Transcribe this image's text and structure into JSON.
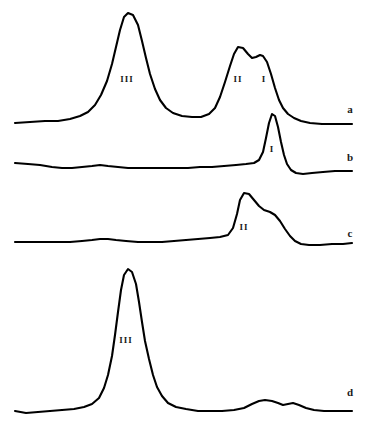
{
  "figure": {
    "type": "spectra-traces",
    "background_color": "#ffffff",
    "line_color": "#000000",
    "label_color": "#1a1a1a",
    "width": 368,
    "height": 428
  },
  "chart_data": {
    "type": "line",
    "title": "",
    "xlabel": "",
    "ylabel": "",
    "grid": false,
    "legend_position": "right-inline",
    "axis_visible": false,
    "xlim": [
      0,
      368
    ],
    "ylim": [
      428,
      0
    ],
    "note": "Four stacked chromatographic / electrophoretic traces labelled a-d; peaks annotated with Roman numerals I, II, III. Y axis is inverted screen space (smaller y = taller peak).",
    "series": [
      {
        "name": "a",
        "label": "a",
        "label_x": 350,
        "label_y": 110,
        "baseline_y": 125,
        "x_start": 15,
        "x_end": 352,
        "peaks": [
          {
            "label": "III",
            "apex_x": 124,
            "apex_y": 13,
            "height": 112,
            "label_x": 127,
            "label_y": 80
          },
          {
            "label": "II",
            "apex_x": 238,
            "apex_y": 46,
            "height": 79,
            "label_x": 238,
            "label_y": 80
          },
          {
            "label": "I",
            "apex_x": 263,
            "apex_y": 56,
            "height": 69,
            "label_x": 264,
            "label_y": 80
          }
        ],
        "path": "M 15,123 L 30,122 L 45,121 L 58,121 L 70,119 L 80,116 L 88,112 L 95,105 L 101,95 L 107,81 L 112,64 L 116,47 L 120,30 L 124,17 L 128,13 L 133,15 L 138,25 L 142,41 L 146,58 L 150,74 L 155,89 L 160,100 L 166,108 L 173,113 L 182,116 L 192,117 L 201,117 L 209,114 L 215,108 L 220,97 L 225,82 L 230,66 L 234,54 L 238,47 L 243,48 L 248,54 L 252,58 L 256,57 L 260,55 L 263,56 L 267,62 L 271,74 L 275,88 L 279,100 L 283,108 L 288,114 L 294,118 L 301,121 L 310,123 L 322,124 L 335,124 L 345,124 L 352,124"
      },
      {
        "name": "b",
        "label": "b",
        "label_x": 350,
        "label_y": 158,
        "baseline_y": 166,
        "x_start": 15,
        "x_end": 352,
        "peaks": [
          {
            "label": "I",
            "apex_x": 272,
            "apex_y": 113,
            "height": 53,
            "label_x": 272,
            "label_y": 150
          }
        ],
        "path": "M 15,163 L 28,164 L 40,165 L 52,167 L 62,168 L 72,168 L 82,167 L 92,166 L 100,165 L 108,166 L 118,167 L 128,168 L 140,168 L 152,168 L 164,168 L 176,168 L 188,168 L 200,167 L 212,167 L 224,166 L 236,165 L 246,164 L 254,163 L 259,160 L 263,152 L 266,138 L 269,123 L 272,114 L 275,116 L 278,127 L 281,142 L 284,155 L 287,164 L 291,170 L 296,173 L 303,174 L 312,173 L 323,172 L 335,171 L 345,171 L 352,171"
      },
      {
        "name": "c",
        "label": "c",
        "label_x": 350,
        "label_y": 234,
        "baseline_y": 243,
        "x_start": 15,
        "x_end": 352,
        "peaks": [
          {
            "label": "II",
            "apex_x": 244,
            "apex_y": 192,
            "height": 51,
            "label_x": 244,
            "label_y": 228
          },
          {
            "label": "shoulder",
            "apex_x": 270,
            "apex_y": 212,
            "height": 31,
            "label_x": null,
            "label_y": null
          }
        ],
        "path": "M 15,242 L 28,242 L 42,242 L 56,242 L 70,242 L 82,241 L 92,240 L 100,239 L 108,239 L 116,240 L 126,241 L 138,242 L 150,242 L 162,242 L 174,241 L 186,240 L 198,239 L 210,238 L 220,237 L 228,235 L 233,228 L 237,214 L 240,200 L 244,193 L 249,194 L 254,200 L 259,206 L 264,210 L 270,212 L 275,215 L 280,221 L 285,229 L 290,236 L 295,241 L 301,244 L 309,245 L 320,245 L 332,244 L 343,244 L 352,243"
      },
      {
        "name": "d",
        "label": "d",
        "label_x": 350,
        "label_y": 393,
        "baseline_y": 412,
        "x_start": 15,
        "x_end": 352,
        "peaks": [
          {
            "label": "III",
            "apex_x": 125,
            "apex_y": 270,
            "height": 142,
            "label_x": 126,
            "label_y": 341
          },
          {
            "label": "minor",
            "apex_x": 265,
            "apex_y": 400,
            "height": 12,
            "label_x": null,
            "label_y": null
          }
        ],
        "path": "M 15,411 L 26,413 L 38,412 L 50,411 L 62,410 L 74,409 L 84,407 L 92,404 L 99,398 L 104,388 L 108,375 L 112,356 L 115,335 L 118,312 L 121,290 L 124,275 L 128,269 L 132,272 L 136,284 L 139,302 L 142,322 L 145,341 L 149,359 L 153,375 L 157,387 L 162,396 L 168,403 L 176,407 L 186,409 L 198,411 L 210,411 L 222,411 L 234,410 L 244,408 L 252,404 L 259,401 L 265,400 L 272,401 L 278,403 L 283,405 L 288,404 L 293,403 L 299,405 L 306,408 L 314,410 L 324,411 L 336,411 L 345,411 L 352,411"
      }
    ]
  }
}
